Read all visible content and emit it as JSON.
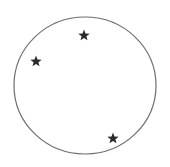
{
  "diagram": {
    "background": "#ffffff",
    "circle": {
      "cx": 85,
      "cy": 85.5,
      "rx": 71,
      "ry": 68.5,
      "stroke": "#6e6e6e",
      "stroke_width": 1.2,
      "fill": "none"
    },
    "stars": [
      {
        "id": "star-top",
        "cx": 84,
        "cy": 35,
        "size": 11,
        "color": "#2b2b2b"
      },
      {
        "id": "star-left",
        "cx": 36,
        "cy": 61,
        "size": 11,
        "color": "#2b2b2b"
      },
      {
        "id": "star-bottom-right",
        "cx": 113,
        "cy": 138,
        "size": 11,
        "color": "#2b2b2b"
      }
    ]
  }
}
